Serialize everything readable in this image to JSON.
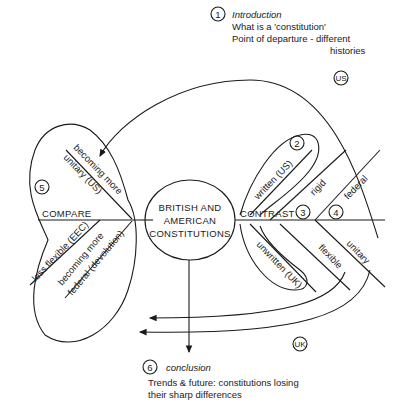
{
  "diagram": {
    "type": "mind-map / essay plan",
    "center": {
      "lines": [
        "BRITISH AND",
        "AMERICAN",
        "CONSTITUTIONS"
      ]
    },
    "sections": [
      {
        "number": "1",
        "title": "Introduction",
        "lines": [
          "What is a 'constitution'",
          "Point of departure - different",
          "histories"
        ]
      },
      {
        "number": "2",
        "items": [
          "written (US)",
          "unwritten (UK)"
        ]
      },
      {
        "number": "3",
        "items": [
          "rigid",
          "flexible"
        ]
      },
      {
        "number": "4",
        "items": [
          "federal",
          "unitary"
        ]
      },
      {
        "number": "5",
        "label": "COMPARE",
        "items": [
          "becoming more",
          "unitary (US)",
          "less flexible (EEC)",
          "becoming more",
          "federal (devolution)"
        ]
      },
      {
        "number": "6",
        "title": "conclusion",
        "lines": [
          "Trends & future: constitutions losing",
          "their sharp differences"
        ]
      }
    ],
    "contrast_label": "CONTRAST",
    "flow_badges": {
      "us": "US",
      "uk": "UK"
    }
  }
}
